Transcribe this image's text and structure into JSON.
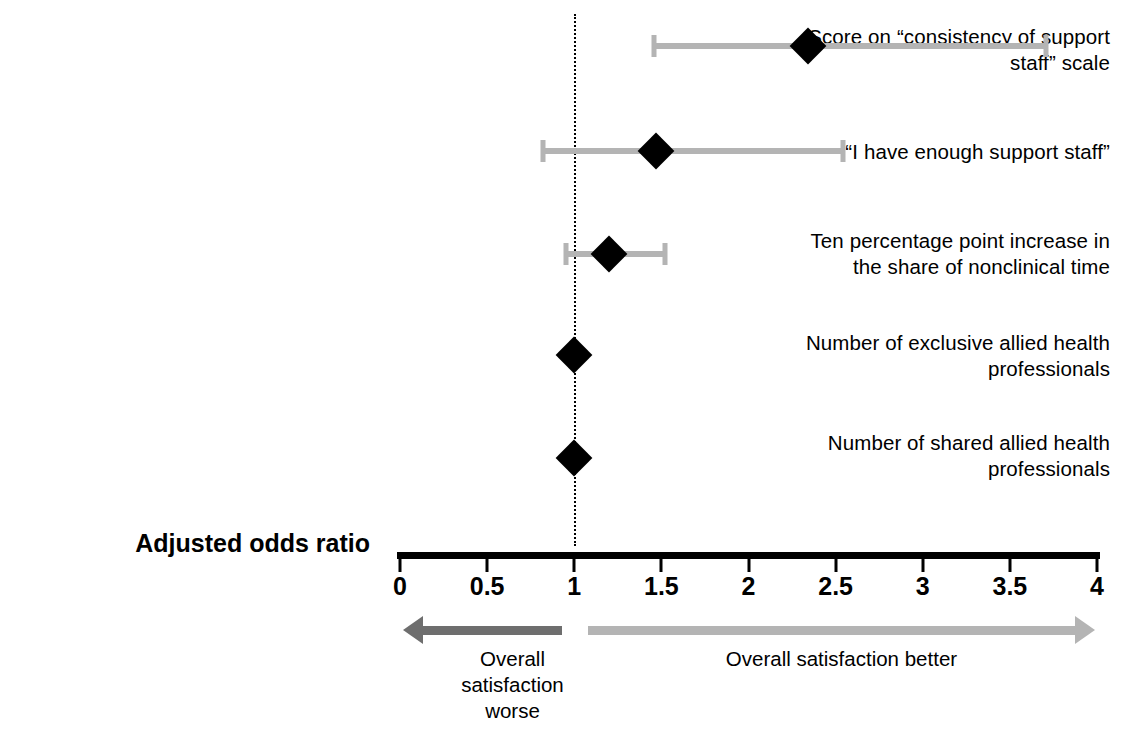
{
  "chart_data": {
    "type": "scatter",
    "subtype": "forest-plot",
    "title": "",
    "xlabel": "Adjusted odds ratio",
    "ylabel": "",
    "xlim": [
      0,
      4
    ],
    "xticks": [
      "0",
      "0.5",
      "1",
      "1.5",
      "2",
      "2.5",
      "3",
      "3.5",
      "4"
    ],
    "xtick_values": [
      0,
      0.5,
      1,
      1.5,
      2,
      2.5,
      3,
      3.5,
      4
    ],
    "reference_line": 1,
    "grid": false,
    "legend": "none",
    "categories": [
      "Score on “consistency of support\nstaff” scale",
      "“I have enough support staff”",
      "Ten percentage point increase in\nthe share of nonclinical time",
      "Number of exclusive allied health\nprofessionals",
      "Number of shared allied health\nprofessionals"
    ],
    "points": [
      {
        "label": "Score on “consistency of support staff” scale",
        "odds_ratio": 2.34,
        "ci_low": 1.46,
        "ci_high": 3.71,
        "has_ci": true
      },
      {
        "label": "“I have enough support staff”",
        "odds_ratio": 1.47,
        "ci_low": 0.82,
        "ci_high": 2.54,
        "has_ci": true
      },
      {
        "label": "Ten percentage point increase in the share of nonclinical time",
        "odds_ratio": 1.2,
        "ci_low": 0.95,
        "ci_high": 1.52,
        "has_ci": true
      },
      {
        "label": "Number of exclusive allied health professionals",
        "odds_ratio": 1.0,
        "ci_low": 1.0,
        "ci_high": 1.0,
        "has_ci": false
      },
      {
        "label": "Number of shared allied health professionals",
        "odds_ratio": 1.0,
        "ci_low": 1.0,
        "ci_high": 1.0,
        "has_ci": false
      }
    ],
    "annotations": {
      "left_arrow_label": "Overall\nsatisfaction\nworse",
      "right_arrow_label": "Overall satisfaction better"
    }
  },
  "colors": {
    "marker": "#000000",
    "ci_bar": "#b4b4b4",
    "axis": "#000000",
    "left_arrow": "#6e6e6e",
    "right_arrow": "#b4b4b4",
    "background": "#ffffff",
    "text": "#000000"
  }
}
